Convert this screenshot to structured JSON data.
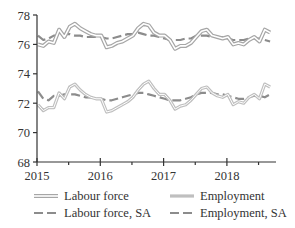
{
  "chart_data": {
    "type": "line",
    "title": "",
    "xlabel": "",
    "ylabel": "",
    "ylim": [
      68,
      78
    ],
    "yticks": [
      68,
      70,
      72,
      74,
      76,
      78
    ],
    "xticks": [
      "2015",
      "2016",
      "2017",
      "2018"
    ],
    "x_start": "2015-01",
    "x_frequency": "monthly",
    "grid": false,
    "legend_position": "bottom",
    "series": [
      {
        "name": "Labour force",
        "style": "double-line",
        "color": "#a6a6a6",
        "values": [
          76.0,
          75.9,
          76.2,
          76.1,
          77.0,
          76.5,
          77.2,
          77.4,
          77.1,
          76.9,
          76.7,
          76.6,
          76.6,
          75.8,
          75.9,
          76.1,
          76.2,
          76.4,
          76.6,
          77.1,
          77.4,
          77.3,
          76.8,
          76.6,
          76.6,
          76.3,
          75.7,
          75.9,
          75.9,
          76.1,
          76.5,
          76.9,
          77.0,
          76.6,
          76.5,
          76.4,
          76.5,
          76.0,
          76.1,
          76.0,
          76.3,
          76.5,
          76.2,
          77.0,
          76.8
        ]
      },
      {
        "name": "Employment",
        "style": "solid-thick",
        "color": "#bfbfbf",
        "values": [
          71.9,
          71.5,
          71.7,
          71.7,
          72.7,
          72.3,
          73.1,
          73.3,
          72.9,
          72.6,
          72.4,
          72.3,
          72.3,
          71.4,
          71.5,
          71.7,
          71.9,
          72.1,
          72.4,
          72.9,
          73.3,
          73.5,
          73.0,
          72.6,
          72.6,
          72.2,
          71.6,
          71.8,
          71.9,
          72.2,
          72.6,
          73.0,
          73.1,
          72.7,
          72.5,
          72.4,
          72.6,
          71.9,
          72.1,
          72.0,
          72.4,
          72.6,
          72.3,
          73.3,
          73.1
        ]
      },
      {
        "name": "Labour force, SA",
        "style": "dashed",
        "color": "#8c8c8c",
        "values": [
          76.6,
          76.3,
          76.4,
          76.6,
          76.6,
          76.7,
          76.7,
          76.6,
          76.6,
          76.5,
          76.5,
          76.5,
          76.5,
          76.4,
          76.4,
          76.5,
          76.6,
          76.7,
          76.7,
          76.8,
          76.7,
          76.6,
          76.6,
          76.5,
          76.4,
          76.3,
          76.3,
          76.3,
          76.4,
          76.4,
          76.6,
          76.6,
          76.6,
          76.5,
          76.5,
          76.5,
          76.4,
          76.3,
          76.3,
          76.3,
          76.4,
          76.4,
          76.4,
          76.3,
          76.2
        ]
      },
      {
        "name": "Employment, SA",
        "style": "dashed",
        "color": "#8c8c8c",
        "values": [
          72.8,
          72.3,
          72.2,
          72.5,
          72.5,
          72.6,
          72.6,
          72.6,
          72.5,
          72.4,
          72.4,
          72.3,
          72.3,
          72.2,
          72.2,
          72.3,
          72.4,
          72.5,
          72.6,
          72.7,
          72.7,
          72.6,
          72.5,
          72.4,
          72.3,
          72.2,
          72.2,
          72.2,
          72.3,
          72.4,
          72.6,
          72.7,
          72.7,
          72.7,
          72.6,
          72.6,
          72.5,
          72.4,
          72.3,
          72.3,
          72.4,
          72.5,
          72.5,
          72.4,
          72.6
        ]
      }
    ]
  },
  "legend": {
    "items": [
      {
        "label": "Labour force",
        "style": "double-line"
      },
      {
        "label": "Employment",
        "style": "solid-thick"
      },
      {
        "label": "Labour force, SA",
        "style": "dashed"
      },
      {
        "label": "Employment, SA",
        "style": "dashed"
      }
    ]
  },
  "axes": {
    "y_tick_labels": [
      "68",
      "70",
      "72",
      "74",
      "76",
      "78"
    ],
    "x_tick_labels": [
      "2015",
      "2016",
      "2017",
      "2018"
    ]
  }
}
